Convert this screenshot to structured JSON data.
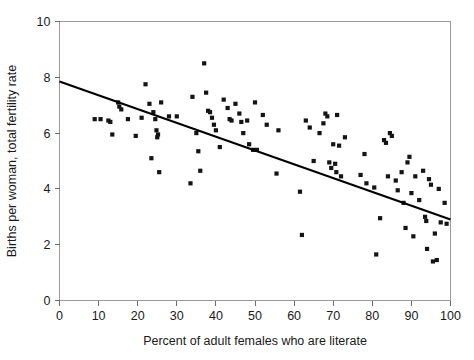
{
  "chart_data": {
    "type": "scatter",
    "title": "",
    "xlabel": "Percent of adult females who are literate",
    "ylabel": "Births per woman, total fertility rate",
    "xlim": [
      0,
      100
    ],
    "ylim": [
      0,
      10
    ],
    "xticks": [
      0,
      10,
      20,
      30,
      40,
      50,
      60,
      70,
      80,
      90,
      100
    ],
    "yticks": [
      0,
      2,
      4,
      6,
      8,
      10
    ],
    "grid": false,
    "legend": null,
    "marker": "square",
    "marker_color": "#141414",
    "points": [
      [
        9.0,
        6.5
      ],
      [
        10.5,
        6.5
      ],
      [
        12.5,
        6.45
      ],
      [
        13.0,
        6.4
      ],
      [
        13.5,
        5.95
      ],
      [
        15.0,
        7.1
      ],
      [
        15.3,
        6.95
      ],
      [
        15.8,
        6.85
      ],
      [
        17.5,
        6.5
      ],
      [
        19.5,
        5.9
      ],
      [
        21.0,
        6.55
      ],
      [
        22.0,
        7.75
      ],
      [
        23.0,
        7.05
      ],
      [
        23.5,
        5.1
      ],
      [
        24.0,
        6.75
      ],
      [
        24.5,
        6.5
      ],
      [
        24.8,
        6.1
      ],
      [
        25.0,
        5.85
      ],
      [
        25.2,
        5.95
      ],
      [
        25.5,
        4.6
      ],
      [
        26.0,
        7.1
      ],
      [
        28.0,
        6.6
      ],
      [
        30.0,
        6.6
      ],
      [
        33.5,
        4.2
      ],
      [
        34.0,
        7.3
      ],
      [
        35.0,
        6.0
      ],
      [
        35.5,
        5.35
      ],
      [
        36.0,
        4.65
      ],
      [
        37.0,
        8.5
      ],
      [
        37.5,
        7.45
      ],
      [
        38.0,
        6.8
      ],
      [
        38.5,
        6.75
      ],
      [
        39.0,
        6.55
      ],
      [
        39.5,
        6.3
      ],
      [
        40.0,
        6.1
      ],
      [
        41.0,
        5.5
      ],
      [
        42.0,
        7.2
      ],
      [
        43.0,
        6.9
      ],
      [
        43.5,
        6.5
      ],
      [
        44.0,
        6.45
      ],
      [
        45.0,
        7.05
      ],
      [
        46.0,
        6.7
      ],
      [
        46.5,
        6.4
      ],
      [
        47.0,
        6.0
      ],
      [
        48.0,
        6.45
      ],
      [
        48.5,
        5.6
      ],
      [
        49.5,
        5.4
      ],
      [
        50.0,
        7.1
      ],
      [
        50.5,
        5.4
      ],
      [
        52.0,
        6.65
      ],
      [
        53.0,
        6.3
      ],
      [
        55.5,
        4.55
      ],
      [
        56.0,
        6.1
      ],
      [
        61.5,
        3.9
      ],
      [
        62.0,
        2.35
      ],
      [
        63.0,
        6.45
      ],
      [
        64.0,
        6.2
      ],
      [
        65.0,
        5.0
      ],
      [
        66.5,
        6.0
      ],
      [
        67.5,
        6.35
      ],
      [
        68.0,
        6.7
      ],
      [
        68.5,
        6.6
      ],
      [
        69.0,
        4.95
      ],
      [
        69.5,
        4.75
      ],
      [
        70.0,
        5.6
      ],
      [
        70.5,
        4.9
      ],
      [
        70.8,
        4.6
      ],
      [
        71.0,
        6.65
      ],
      [
        71.5,
        5.55
      ],
      [
        72.0,
        4.45
      ],
      [
        73.0,
        5.85
      ],
      [
        77.0,
        4.5
      ],
      [
        78.0,
        5.25
      ],
      [
        78.5,
        4.2
      ],
      [
        80.5,
        4.05
      ],
      [
        81.0,
        1.65
      ],
      [
        82.0,
        2.95
      ],
      [
        83.0,
        5.75
      ],
      [
        83.5,
        5.65
      ],
      [
        84.0,
        4.45
      ],
      [
        84.5,
        6.0
      ],
      [
        85.0,
        5.9
      ],
      [
        86.0,
        4.3
      ],
      [
        86.5,
        3.95
      ],
      [
        87.5,
        4.6
      ],
      [
        88.0,
        3.5
      ],
      [
        88.5,
        2.6
      ],
      [
        89.0,
        4.95
      ],
      [
        89.5,
        5.15
      ],
      [
        90.0,
        3.85
      ],
      [
        90.5,
        2.3
      ],
      [
        91.0,
        4.45
      ],
      [
        92.0,
        3.6
      ],
      [
        93.0,
        4.65
      ],
      [
        93.5,
        3.0
      ],
      [
        93.8,
        2.85
      ],
      [
        94.0,
        1.85
      ],
      [
        94.5,
        4.35
      ],
      [
        95.0,
        4.15
      ],
      [
        95.5,
        1.4
      ],
      [
        96.0,
        2.4
      ],
      [
        96.5,
        1.45
      ],
      [
        97.0,
        4.0
      ],
      [
        97.5,
        2.8
      ],
      [
        98.5,
        3.5
      ],
      [
        99.0,
        2.75
      ]
    ],
    "trend_line": {
      "x": [
        0,
        100
      ],
      "y": [
        7.85,
        2.9
      ]
    }
  }
}
